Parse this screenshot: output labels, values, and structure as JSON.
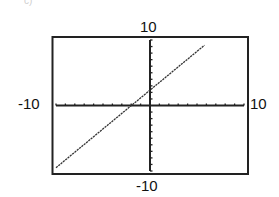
{
  "chart_data": {
    "type": "line",
    "title": "",
    "xlabel": "",
    "ylabel": "",
    "xlim": [
      -10,
      10
    ],
    "ylim": [
      -10,
      10
    ],
    "tick_step": 1,
    "grid": false,
    "labels": {
      "ymax": "10",
      "ymin": "-10",
      "xmin": "-10",
      "xmax": "10"
    },
    "series": [
      {
        "name": "line",
        "equation_estimate": "y ≈ 1.2x + 2.3",
        "x": [
          -10,
          5.8
        ],
        "y": [
          -9.5,
          9.2
        ]
      }
    ],
    "intercepts": {
      "x": -2,
      "y": 2.3
    },
    "colors": {
      "frame": "#222222",
      "axes": "#222222",
      "line": "#333333"
    }
  },
  "fragment_label": "c)"
}
